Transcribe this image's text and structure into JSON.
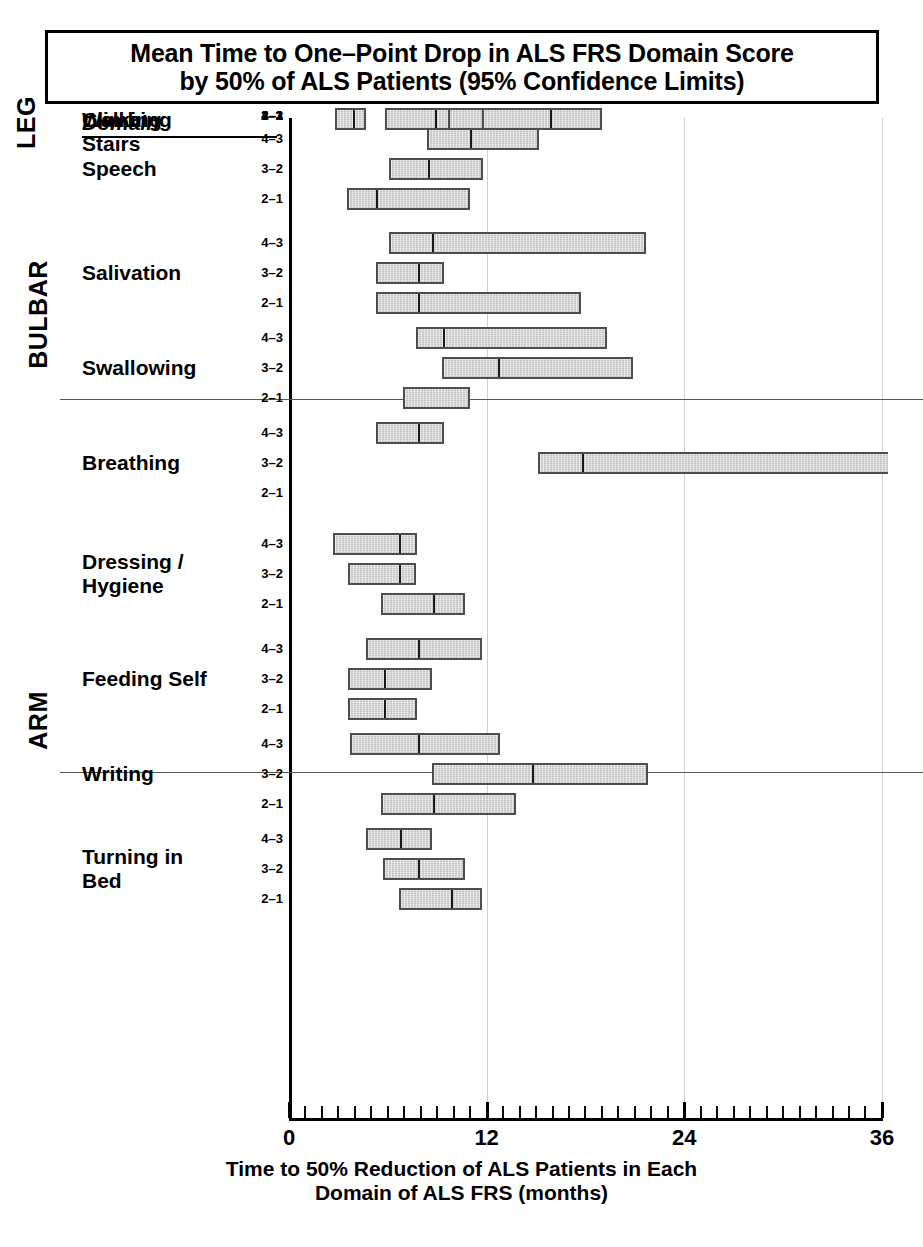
{
  "title": {
    "line1": "Mean Time to One–Point Drop in ALS FRS Domain Score",
    "line2": "by 50% of ALS Patients (95% Confidence Limits)"
  },
  "domain_header": "Domain",
  "axis": {
    "xlabel_line1": "Time to 50% Reduction of ALS Patients in Each",
    "xlabel_line2": "Domain of ALS FRS (months)",
    "ticks": [
      "0",
      "12",
      "24",
      "36"
    ]
  },
  "groups": [
    {
      "label": "BULBAR"
    },
    {
      "label": "ARM"
    },
    {
      "label": "LEG"
    }
  ],
  "chart_data": {
    "type": "bar",
    "subtype": "horizontal-confidence-interval",
    "title": "Mean Time to One–Point Drop in ALS FRS Domain Score by 50% of ALS Patients (95% Confidence Limits)",
    "xlabel": "Time to 50% Reduction of ALS Patients in Each Domain of ALS FRS (months)",
    "ylabel": "Domain",
    "xlim": [
      0,
      36
    ],
    "xticks": [
      0,
      12,
      24,
      36
    ],
    "xtick_minor_step": 1,
    "grid": "vertical-light-at-12-24-36",
    "legend": "none",
    "units": "months",
    "value_keys": [
      "lower_cl",
      "mean",
      "upper_cl"
    ],
    "groups": [
      {
        "group": "BULBAR",
        "domains": [
          {
            "domain": "Speech",
            "transitions": [
              {
                "transition": "4–3",
                "lower_cl": 8.4,
                "mean": 10.9,
                "upper_cl": 15.2
              },
              {
                "transition": "3–2",
                "lower_cl": 6.1,
                "mean": 8.4,
                "upper_cl": 11.8
              },
              {
                "transition": "2–1",
                "lower_cl": 3.5,
                "mean": 5.2,
                "upper_cl": 11.0
              }
            ]
          },
          {
            "domain": "Salivation",
            "transitions": [
              {
                "transition": "4–3",
                "lower_cl": 6.1,
                "mean": 8.6,
                "upper_cl": 21.7
              },
              {
                "transition": "3–2",
                "lower_cl": 5.3,
                "mean": 7.8,
                "upper_cl": 9.4
              },
              {
                "transition": "2–1",
                "lower_cl": 5.3,
                "mean": 7.8,
                "upper_cl": 17.7
              }
            ]
          },
          {
            "domain": "Swallowing",
            "transitions": [
              {
                "transition": "4–3",
                "lower_cl": 7.7,
                "mean": 9.3,
                "upper_cl": 19.3
              },
              {
                "transition": "3–2",
                "lower_cl": 9.3,
                "mean": 12.6,
                "upper_cl": 20.9
              },
              {
                "transition": "2–1",
                "lower_cl": 6.9,
                "mean": null,
                "upper_cl": 11.0
              }
            ]
          },
          {
            "domain": "Breathing",
            "transitions": [
              {
                "transition": "4–3",
                "lower_cl": 5.3,
                "mean": 7.8,
                "upper_cl": 9.4
              },
              {
                "transition": "3–2",
                "lower_cl": 15.1,
                "mean": 17.7,
                "upper_cl": 36.0,
                "upper_truncated": true
              },
              {
                "transition": "2–1",
                "lower_cl": null,
                "mean": null,
                "upper_cl": null
              }
            ]
          }
        ]
      },
      {
        "group": "ARM",
        "domains": [
          {
            "domain": "Dressing / Hygiene",
            "transitions": [
              {
                "transition": "4–3",
                "lower_cl": 2.7,
                "mean": 6.6,
                "upper_cl": 7.8
              },
              {
                "transition": "3–2",
                "lower_cl": 3.6,
                "mean": 6.6,
                "upper_cl": 7.7
              },
              {
                "transition": "2–1",
                "lower_cl": 5.6,
                "mean": 8.7,
                "upper_cl": 10.7
              }
            ]
          },
          {
            "domain": "Feeding Self",
            "transitions": [
              {
                "transition": "4–3",
                "lower_cl": 4.7,
                "mean": 7.8,
                "upper_cl": 11.7
              },
              {
                "transition": "3–2",
                "lower_cl": 3.6,
                "mean": 5.7,
                "upper_cl": 8.7
              },
              {
                "transition": "2–1",
                "lower_cl": 3.6,
                "mean": 5.7,
                "upper_cl": 7.8
              }
            ]
          },
          {
            "domain": "Writing",
            "transitions": [
              {
                "transition": "4–3",
                "lower_cl": 3.7,
                "mean": 7.8,
                "upper_cl": 12.8
              },
              {
                "transition": "3–2",
                "lower_cl": 8.7,
                "mean": 14.7,
                "upper_cl": 21.8
              },
              {
                "transition": "2–1",
                "lower_cl": 5.6,
                "mean": 8.7,
                "upper_cl": 13.8
              }
            ]
          },
          {
            "domain": "Turning in Bed",
            "transitions": [
              {
                "transition": "4–3",
                "lower_cl": 4.7,
                "mean": 6.7,
                "upper_cl": 8.7
              },
              {
                "transition": "3–2",
                "lower_cl": 5.7,
                "mean": 7.8,
                "upper_cl": 10.7
              },
              {
                "transition": "2–1",
                "lower_cl": 6.7,
                "mean": 9.8,
                "upper_cl": 11.7
              }
            ]
          }
        ]
      },
      {
        "group": "LEG",
        "domains": [
          {
            "domain": "Climbing Stairs",
            "transitions": [
              {
                "transition": "4–3",
                "lower_cl": 6.7,
                "mean": 8.7,
                "upper_cl": 17.8
              },
              {
                "transition": "3–2",
                "lower_cl": 5.8,
                "mean": 8.7,
                "upper_cl": 13.8
              },
              {
                "transition": "2–1",
                "lower_cl": 2.8,
                "mean": 3.8,
                "upper_cl": 4.7
              }
            ]
          },
          {
            "domain": "Walking",
            "transitions": [
              {
                "transition": "4–3",
                "lower_cl": 6.7,
                "mean": 8.7,
                "upper_cl": 14.8
              },
              {
                "transition": "3–2",
                "lower_cl": 5.8,
                "mean": 8.8,
                "upper_cl": 9.8
              },
              {
                "transition": "2–1",
                "lower_cl": 11.7,
                "mean": 15.8,
                "upper_cl": 19.0
              }
            ]
          }
        ]
      }
    ]
  },
  "layout": {
    "x0_px": 289,
    "px_per_month": 16.47,
    "row_step_px": 30,
    "domain_gap_px": 18,
    "group_sep_y": [
      399,
      772
    ],
    "row_tops": [
      128,
      158,
      188,
      232,
      262,
      292,
      327,
      357,
      387,
      422,
      452,
      482,
      533,
      563,
      593,
      638,
      668,
      698,
      733,
      763,
      793,
      828,
      858,
      888
    ]
  }
}
